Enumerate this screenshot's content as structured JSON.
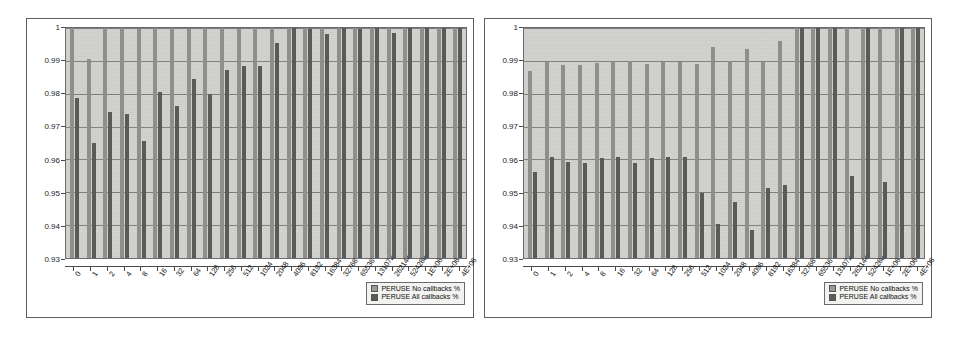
{
  "page": {
    "ghost_text_top": "scanned page bleed-through",
    "ghost_text_bottom": "scanned page bleed-through"
  },
  "legend": {
    "series0_label": "PERUSE No callbacks %",
    "series1_label": "PERUSE All callbacks %",
    "series0_color": "#9a9a97",
    "series1_color": "#5a5a58"
  },
  "chart_data": [
    {
      "type": "bar",
      "title": "",
      "xlabel": "",
      "ylabel": "",
      "ylim": [
        0.93,
        1
      ],
      "yticks": [
        0.93,
        0.94,
        0.95,
        0.96,
        0.97,
        0.98,
        0.99,
        1
      ],
      "ytick_labels": [
        "0.93",
        "0.94",
        "0.95",
        "0.96",
        "0.97",
        "0.98",
        "0.99",
        "1"
      ],
      "grid": true,
      "legend_position": "bottom-right",
      "categories": [
        "0",
        "1",
        "2",
        "4",
        "8",
        "16",
        "32",
        "64",
        "128",
        "256",
        "512",
        "1024",
        "2048",
        "4096",
        "8192",
        "16384",
        "32768",
        "65536",
        "131072",
        "262144",
        "524288",
        "1E+06",
        "2E+06",
        "4E+06"
      ],
      "series": [
        {
          "name": "PERUSE No callbacks %",
          "values": [
            1.0,
            0.9905,
            1.0,
            1.0,
            0.9998,
            1.0,
            1.0,
            0.9998,
            1.0,
            1.0,
            0.9998,
            1.0,
            1.0,
            0.9999,
            1.0,
            1.0,
            1.0,
            1.0,
            1.0,
            1.0,
            1.0,
            1.0,
            1.0,
            1.0
          ]
        },
        {
          "name": "PERUSE All callbacks %",
          "values": [
            0.9786,
            0.9651,
            0.9745,
            0.9737,
            0.9655,
            0.9806,
            0.9762,
            0.9845,
            0.9799,
            0.9872,
            0.9884,
            0.9884,
            0.9955,
            0.9999,
            0.9996,
            0.9983,
            0.9999,
            0.9998,
            0.9999,
            0.9984,
            0.9999,
            1.0,
            1.0,
            1.0
          ]
        }
      ]
    },
    {
      "type": "bar",
      "title": "",
      "xlabel": "",
      "ylabel": "",
      "ylim": [
        0.93,
        1
      ],
      "yticks": [
        0.93,
        0.94,
        0.95,
        0.96,
        0.97,
        0.98,
        0.99,
        1
      ],
      "ytick_labels": [
        "0.93",
        "0.94",
        "0.95",
        "0.96",
        "0.97",
        "0.98",
        "0.99",
        "1"
      ],
      "grid": true,
      "legend_position": "bottom-right",
      "categories": [
        "0",
        "1",
        "2",
        "4",
        "8",
        "16",
        "32",
        "64",
        "128",
        "256",
        "512",
        "1024",
        "2048",
        "4096",
        "8192",
        "16384",
        "32768",
        "65536",
        "131072",
        "262144",
        "524288",
        "1E+06",
        "2E+06",
        "4E+06"
      ],
      "series": [
        {
          "name": "PERUSE No callbacks %",
          "values": [
            0.9869,
            0.9896,
            0.9888,
            0.9886,
            0.9895,
            0.9899,
            0.9899,
            0.9892,
            0.9896,
            0.9897,
            0.9892,
            0.9942,
            0.9899,
            0.9937,
            0.9896,
            0.9959,
            1.0,
            1.0,
            1.0,
            1.0,
            1.0,
            1.0,
            1.0,
            1.0
          ],
          "note": "bars hidden behind the plot-area for categories 0-15 reach near 0.99"
        },
        {
          "name": "PERUSE All callbacks %",
          "values": [
            0.9562,
            0.9607,
            0.9592,
            0.9589,
            0.9603,
            0.9607,
            0.9588,
            0.9603,
            0.9607,
            0.9607,
            0.9497,
            0.9405,
            0.947,
            0.9386,
            0.9512,
            0.9523,
            1.0,
            1.0,
            1.0,
            0.9549,
            1.0,
            0.953,
            1.0,
            1.0
          ]
        }
      ]
    }
  ]
}
